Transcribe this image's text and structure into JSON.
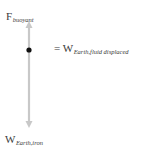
{
  "diagram": {
    "type": "free-body diagram",
    "forces": [
      {
        "symbol": "F",
        "subscript": "buoyant",
        "direction": "up",
        "note": "= W",
        "note_subscript": "Earth,fluid displaced"
      },
      {
        "symbol": "W",
        "subscript": "Earth,iron",
        "direction": "down"
      }
    ],
    "colors": {
      "arrow": "#c8c8c8",
      "dot": "#111111",
      "text": "#3a3a3a"
    }
  },
  "labels": {
    "top_symbol": "F",
    "top_sub": "buoyant",
    "eq_prefix": "= W",
    "eq_sub": "Earth,fluid displaced",
    "bottom_symbol": "W",
    "bottom_sub": "Earth,iron"
  }
}
